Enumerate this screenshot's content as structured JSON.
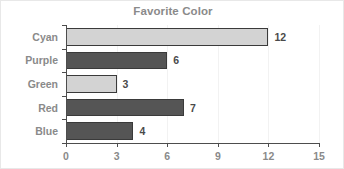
{
  "chart_data": {
    "type": "bar",
    "orientation": "horizontal",
    "title": "Favorite Color",
    "xlabel": "",
    "ylabel": "",
    "categories": [
      "Cyan",
      "Purple",
      "Green",
      "Red",
      "Blue"
    ],
    "values": [
      12,
      6,
      3,
      7,
      4
    ],
    "value_labels": [
      "12",
      "6",
      "3",
      "7",
      "4"
    ],
    "bar_colors": [
      "#d3d3d3",
      "#555555",
      "#d3d3d3",
      "#555555",
      "#555555"
    ],
    "bar_border_color": "#3a3a3a",
    "xlim": [
      0,
      15
    ],
    "xticks": [
      0,
      3,
      6,
      9,
      12,
      15
    ],
    "xtick_labels": [
      "0",
      "3",
      "6",
      "9",
      "12",
      "15"
    ],
    "grid": true,
    "grid_axis": "x",
    "legend": false,
    "title_color": "#8a8a8a",
    "tick_label_color": "#8a8a8a",
    "axis_color": "#4d4d4d",
    "background": "#ffffff"
  }
}
